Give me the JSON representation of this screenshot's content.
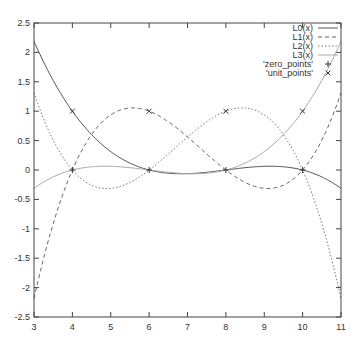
{
  "chart_data": {
    "type": "line",
    "title": "",
    "xlabel": "",
    "ylabel": "",
    "xlim": [
      3,
      11
    ],
    "ylim": [
      -2.5,
      2.5
    ],
    "grid": false,
    "legend_position": "top-right",
    "x_ticks": [
      "3",
      "4",
      "5",
      "6",
      "7",
      "8",
      "9",
      "10",
      "11"
    ],
    "y_ticks": [
      "2.5",
      "2",
      "1.5",
      "1",
      "0.5",
      "0",
      "-0.5",
      "-1",
      "-1.5",
      "-2",
      "-2.5"
    ],
    "x": [
      3,
      3.5,
      4,
      4.5,
      5,
      5.5,
      6,
      6.5,
      7,
      7.5,
      8,
      8.5,
      9,
      9.5,
      10,
      10.5,
      11
    ],
    "series": [
      {
        "name": "L0(x)",
        "style": "solid",
        "color": "#555555",
        "values": [
          2.1875,
          1.5234,
          1,
          0.6016,
          0.3125,
          0.1172,
          0,
          -0.0547,
          -0.0625,
          -0.0391,
          0,
          0.0391,
          0.0625,
          0.0547,
          0,
          -0.1172,
          -0.3125
        ]
      },
      {
        "name": "L1(x)",
        "style": "dashed",
        "color": "#666666",
        "values": [
          -2.1875,
          -0.9141,
          0,
          0.6016,
          0.9375,
          1.0547,
          1,
          0.8203,
          0.5625,
          0.2734,
          0,
          -0.2109,
          -0.3125,
          -0.2578,
          0,
          0.5078,
          1.3125
        ]
      },
      {
        "name": "L2(x)",
        "style": "dotted",
        "color": "#777777",
        "values": [
          1.3125,
          0.5078,
          0,
          -0.2578,
          -0.3125,
          -0.2109,
          0,
          0.2734,
          0.5625,
          0.8203,
          1,
          1.0547,
          0.9375,
          0.6016,
          0,
          -0.9141,
          -2.1875
        ]
      },
      {
        "name": "L3(x)",
        "style": "solid",
        "color": "#aaaaaa",
        "values": [
          -0.3125,
          -0.1172,
          0,
          0.0547,
          0.0625,
          0.0391,
          0,
          -0.0391,
          -0.0625,
          -0.0547,
          0,
          0.1172,
          0.3125,
          0.6016,
          1,
          1.5234,
          2.1875
        ]
      }
    ],
    "points": [
      {
        "name": "'zero_points'",
        "marker": "+",
        "x": [
          4,
          6,
          8,
          10
        ],
        "y": [
          0,
          0,
          0,
          0
        ]
      },
      {
        "name": "'unit_points'",
        "marker": "x",
        "x": [
          4,
          6,
          8,
          10
        ],
        "y": [
          1,
          1,
          1,
          1
        ]
      }
    ]
  }
}
